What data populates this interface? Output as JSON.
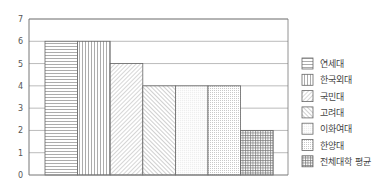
{
  "chart_data": {
    "type": "bar",
    "title": "",
    "xlabel": "",
    "ylabel": "",
    "ylim": [
      0,
      7
    ],
    "yticks": [
      0,
      1,
      2,
      3,
      4,
      5,
      6,
      7
    ],
    "grid": true,
    "legend_position": "right",
    "categories": [
      "연세대",
      "한국외대",
      "국민대",
      "고려대",
      "이화여대",
      "한양대",
      "전체대학 평균"
    ],
    "values": [
      6,
      6,
      5,
      4,
      4,
      4,
      2
    ],
    "patterns": [
      "horizontal",
      "vertical",
      "diagonal-up",
      "diagonal-down",
      "dots-fine",
      "dots",
      "grid"
    ]
  },
  "legend": {
    "items": [
      {
        "label": "연세대",
        "pattern": "horizontal"
      },
      {
        "label": "한국외대",
        "pattern": "vertical"
      },
      {
        "label": "국민대",
        "pattern": "diagonal-up"
      },
      {
        "label": "고려대",
        "pattern": "diagonal-down"
      },
      {
        "label": "이화여대",
        "pattern": "dots-fine"
      },
      {
        "label": "한양대",
        "pattern": "dots"
      },
      {
        "label": "전체대학 평균",
        "pattern": "grid"
      }
    ]
  },
  "colors": {
    "axis": "#777777",
    "grid": "#bbbbbb",
    "bar_edge": "#666666",
    "text": "#555555"
  }
}
